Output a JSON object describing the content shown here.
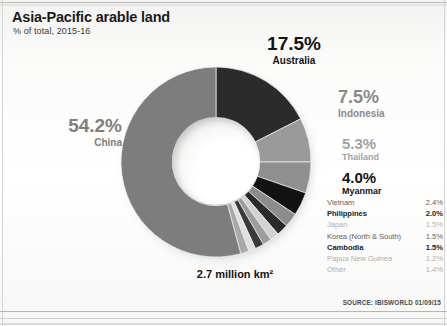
{
  "header": {
    "title": "Asia-Pacific arable land",
    "subtitle": "% of total, 2015-16"
  },
  "total_label": "2.7 million km²",
  "source": "SOURCE: IBISWORLD 01/09/15",
  "callouts": {
    "australia": {
      "pct": "17.5%",
      "name": "Australia"
    },
    "indonesia": {
      "pct": "7.5%",
      "name": "Indonesia"
    },
    "thailand": {
      "pct": "5.3%",
      "name": "Thailand"
    },
    "myanmar": {
      "pct": "4.0%",
      "name": "Myanmar"
    },
    "china": {
      "pct": "54.2%",
      "name": "China"
    }
  },
  "legend": [
    {
      "name": "Vietnam",
      "value": "2.4%",
      "tone": "tone-mid"
    },
    {
      "name": "Philippines",
      "value": "2.0%",
      "tone": "tone-dark"
    },
    {
      "name": "Japan",
      "value": "1.5%",
      "tone": "tone-light"
    },
    {
      "name": "Korea (North & South)",
      "value": "1.5%",
      "tone": "tone-mid"
    },
    {
      "name": "Cambodia",
      "value": "1.5%",
      "tone": "tone-dark"
    },
    {
      "name": "Papua New Guinea",
      "value": "1.2%",
      "tone": "tone-light"
    },
    {
      "name": "Other",
      "value": "1.4%",
      "tone": "tone-light"
    }
  ],
  "colors": {
    "australia": "#2b2b2b",
    "indonesia": "#9a9a9a",
    "thailand": "#8f8f8f",
    "myanmar": "#121212",
    "vietnam": "#8c8c8c",
    "philippines": "#2a2a2a",
    "japan": "#d2d2d2",
    "korea": "#9d9d9d",
    "cambodia": "#3a3a3a",
    "png": "#e0e0e0",
    "other": "#a8a8a8",
    "china": "#7d7d7d"
  },
  "chart_data": {
    "type": "pie",
    "title": "Asia-Pacific arable land",
    "subtitle": "% of total, 2015-16",
    "unit": "% of total",
    "total": "2.7 million km²",
    "categories": [
      "Australia",
      "Indonesia",
      "Thailand",
      "Myanmar",
      "Vietnam",
      "Philippines",
      "Japan",
      "Korea (North & South)",
      "Cambodia",
      "Papua New Guinea",
      "Other",
      "China"
    ],
    "values": [
      17.5,
      7.5,
      5.3,
      4.0,
      2.4,
      2.0,
      1.5,
      1.5,
      1.5,
      1.2,
      1.4,
      54.2
    ],
    "start_angle_deg": 0,
    "direction": "clockwise",
    "donut": true,
    "inner_radius_ratio": 0.46,
    "legend_position": "right",
    "grid": false
  }
}
